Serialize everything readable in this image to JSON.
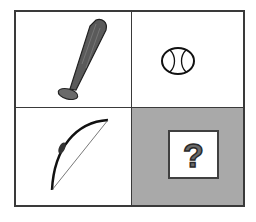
{
  "puzzle": {
    "type": "analogy-grid",
    "cells": [
      {
        "position": "top-left",
        "item": "baseball-bat"
      },
      {
        "position": "top-right",
        "item": "baseball"
      },
      {
        "position": "bottom-left",
        "item": "bow"
      },
      {
        "position": "bottom-right",
        "item": "unknown",
        "symbol": "?"
      }
    ],
    "colors": {
      "border": "#3a3a3a",
      "unknown_bg": "#a9a9a9"
    }
  }
}
